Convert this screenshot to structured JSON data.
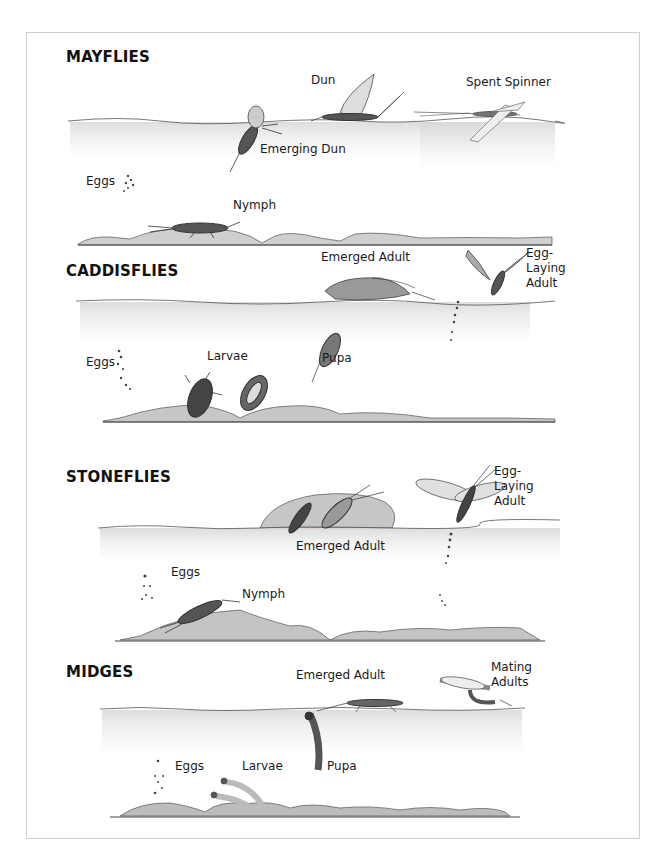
{
  "sections": [
    {
      "heading": "MAYFLIES",
      "labels": {
        "eggs": "Eggs",
        "nymph": "Nymph",
        "emerging_dun": "Emerging Dun",
        "dun": "Dun",
        "spent_spinner": "Spent Spinner"
      }
    },
    {
      "heading": "CADDISFLIES",
      "labels": {
        "eggs": "Eggs",
        "larvae": "Larvae",
        "pupa": "Pupa",
        "emerged_adult": "Emerged Adult",
        "egg_laying_adult": "Egg-\nLaying\nAdult"
      }
    },
    {
      "heading": "STONEFLIES",
      "labels": {
        "eggs": "Eggs",
        "nymph": "Nymph",
        "emerged_adult": "Emerged Adult",
        "egg_laying_adult": "Egg-\nLaying\nAdult"
      }
    },
    {
      "heading": "MIDGES",
      "labels": {
        "eggs": "Eggs",
        "larvae": "Larvae",
        "pupa": "Pupa",
        "emerged_adult": "Emerged Adult",
        "mating_adults": "Mating\nAdults"
      }
    }
  ],
  "colors": {
    "water": "#e6e6e6",
    "bed": "#bdbdbd",
    "insect": "#3a3a3a",
    "wing": "#c8c8c8"
  }
}
